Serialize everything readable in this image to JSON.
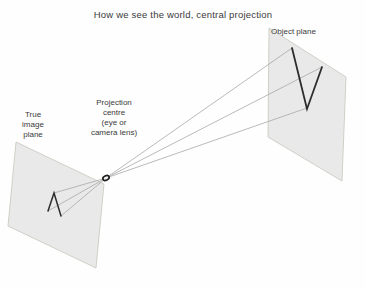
{
  "title": "How we see the world, central projection",
  "labels": {
    "object_plane": "Object plane",
    "true_image_plane": {
      "lines": [
        "True",
        "image",
        "plane"
      ]
    },
    "projection_centre": {
      "lines": [
        "Projection",
        "centre",
        "(eye or",
        "camera lens)"
      ]
    }
  },
  "colors": {
    "background": "#fefefe",
    "plane_fill": "#e9e9e9",
    "plane_border": "#c6c6bd",
    "ray": "#a8a8a8",
    "shape_stroke": "#2d2d2d",
    "ellipse_stroke": "#1f1f1f",
    "ellipse_fill": "#f4f4f4",
    "text": "#3a3a3a"
  }
}
